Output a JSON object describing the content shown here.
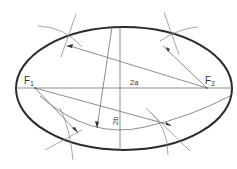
{
  "diagram": {
    "type": "ellipse-construction",
    "labels": {
      "focus1": "F",
      "focus1_sub": "1",
      "focus2": "F",
      "focus2_sub": "2",
      "major_axis": "2a",
      "minor_axis": "2b"
    },
    "colors": {
      "ellipse": "#2a2a2a",
      "lines": "#707070",
      "text": "#333333",
      "background": "#ffffff"
    }
  }
}
